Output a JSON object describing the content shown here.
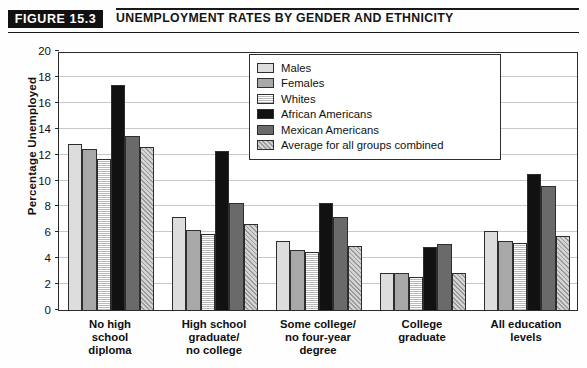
{
  "header": {
    "badge": "FIGURE 15.3",
    "title": "UNEMPLOYMENT RATES BY GENDER AND ETHNICITY"
  },
  "source_note": "",
  "chart_data": {
    "type": "bar",
    "title": "UNEMPLOYMENT RATES BY GENDER AND ETHNICITY",
    "xlabel": "",
    "ylabel": "Percentage Unemployed",
    "ylim": [
      0,
      20
    ],
    "yticks": [
      0,
      2,
      4,
      6,
      8,
      10,
      12,
      14,
      16,
      18,
      20
    ],
    "ytick_labels": [
      "0",
      "2",
      "4",
      "6",
      "8",
      "10",
      "12",
      "14",
      "16",
      "18",
      "20"
    ],
    "grid": true,
    "legend_position": "top-center-inside",
    "categories": [
      "No high\nschool\ndiploma",
      "High school\ngraduate/\nno college",
      "Some college/\nno four-year\ndegree",
      "College\ngraduate",
      "All education\nlevels"
    ],
    "series": [
      {
        "name": "Males",
        "color": "#dddddd",
        "pattern": "solid",
        "values": [
          12.8,
          7.2,
          5.3,
          2.85,
          6.1
        ]
      },
      {
        "name": "Females",
        "color": "#a8a8a8",
        "pattern": "solid",
        "values": [
          12.4,
          6.2,
          4.65,
          2.85,
          5.35
        ]
      },
      {
        "name": "Whites",
        "color": "#f0f0f0",
        "pattern": "horizontal",
        "values": [
          11.7,
          5.85,
          4.5,
          2.55,
          5.15
        ]
      },
      {
        "name": "African Americans",
        "color": "#111111",
        "pattern": "solid",
        "values": [
          17.4,
          12.3,
          8.25,
          4.85,
          10.5
        ]
      },
      {
        "name": "Mexican Americans",
        "color": "#6a6a6a",
        "pattern": "solid",
        "values": [
          13.4,
          8.3,
          7.15,
          5.1,
          9.6
        ]
      },
      {
        "name": "Average for all groups combined",
        "color": "#d4d4d4",
        "pattern": "diagonal",
        "values": [
          12.6,
          6.65,
          4.95,
          2.85,
          5.75
        ]
      }
    ]
  }
}
